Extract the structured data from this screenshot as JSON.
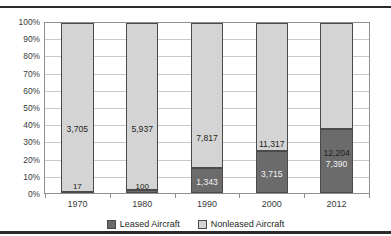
{
  "figure": {
    "title": "Exhibit 4: Growth of Leased Aircraft 1970-2012"
  },
  "colors": {
    "leased": "#6b6b6b",
    "nonleased": "#d4d4d4",
    "border": "#4a4a4a",
    "grid": "#c9c9c9",
    "axis": "#8f8f8f",
    "text": "#231f20"
  },
  "legend": {
    "position": "bottom-center",
    "items": [
      {
        "label": "Leased Aircraft",
        "color": "#6b6b6b"
      },
      {
        "label": "Nonleased Aircraft",
        "color": "#d4d4d4"
      }
    ]
  },
  "chart_data": {
    "type": "bar",
    "stacked": true,
    "stack_mode": "percent",
    "title": "Exhibit 4: Growth of Leased Aircraft 1970-2012",
    "xlabel": "",
    "ylabel": "",
    "grid": true,
    "ylim": [
      0,
      100
    ],
    "categories": [
      "1970",
      "1980",
      "1990",
      "2000",
      "2012"
    ],
    "ytick_labels": [
      "0%",
      "10%",
      "20%",
      "30%",
      "40%",
      "50%",
      "60%",
      "70%",
      "80%",
      "90%",
      "100%"
    ],
    "ytick_values": [
      0,
      10,
      20,
      30,
      40,
      50,
      60,
      70,
      80,
      90,
      100
    ],
    "series": [
      {
        "name": "Leased Aircraft",
        "color": "#6b6b6b",
        "values": [
          17,
          100,
          1343,
          3715,
          7390
        ],
        "labels": [
          "17",
          "100",
          "1,343",
          "3,715",
          "7,390"
        ],
        "percent": [
          0.46,
          1.66,
          14.66,
          24.72,
          37.72
        ]
      },
      {
        "name": "Nonleased Aircraft",
        "color": "#d4d4d4",
        "values": [
          3705,
          5937,
          7817,
          11317,
          12204
        ],
        "labels": [
          "3,705",
          "5,937",
          "7,817",
          "11,317",
          "12,204"
        ],
        "percent": [
          99.54,
          98.34,
          85.34,
          75.28,
          62.28
        ]
      }
    ],
    "totals": [
      3722,
      6037,
      9160,
      15032,
      19594
    ]
  }
}
